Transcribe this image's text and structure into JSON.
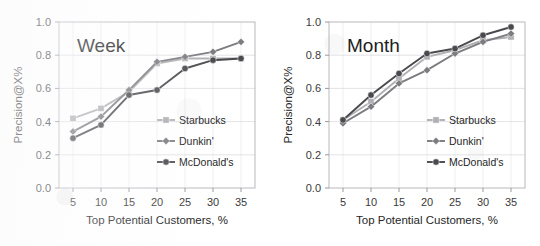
{
  "figure": {
    "panel_count": 2,
    "series_colors": {
      "starbucks": "#b0b0b4",
      "dunkin": "#7c7c80",
      "mcdonalds": "#4a4a4e"
    },
    "marker_shapes": {
      "starbucks": "square",
      "dunkin": "diamond",
      "mcdonalds": "circle"
    }
  },
  "chart_data": [
    {
      "type": "line",
      "title": "Week",
      "xlabel": "Top Potential Customers, %",
      "ylabel": "Precision@X%",
      "x": [
        5,
        10,
        15,
        20,
        25,
        30,
        35
      ],
      "xticklabels": [
        "5",
        "10",
        "15",
        "20",
        "25",
        "30",
        "35"
      ],
      "yticklabels": [
        "0.0",
        "0.2",
        "0.4",
        "0.6",
        "0.8",
        "1.0"
      ],
      "xlim": [
        2.5,
        37.5
      ],
      "ylim": [
        0.0,
        1.0
      ],
      "grid": true,
      "legend_position": "lower-right-inside",
      "series": [
        {
          "name": "Starbucks",
          "values": [
            0.42,
            0.48,
            0.58,
            0.75,
            0.78,
            0.78,
            0.78
          ]
        },
        {
          "name": "Dunkin'",
          "values": [
            0.34,
            0.43,
            0.59,
            0.76,
            0.79,
            0.82,
            0.88
          ]
        },
        {
          "name": "McDonald's",
          "values": [
            0.3,
            0.38,
            0.56,
            0.59,
            0.72,
            0.77,
            0.78
          ]
        }
      ]
    },
    {
      "type": "line",
      "title": "Month",
      "xlabel": "Top Potential Customers, %",
      "ylabel": "Precision@X%",
      "x": [
        5,
        10,
        15,
        20,
        25,
        30,
        35
      ],
      "xticklabels": [
        "5",
        "10",
        "15",
        "20",
        "25",
        "30",
        "35"
      ],
      "yticklabels": [
        "0.0",
        "0.2",
        "0.4",
        "0.6",
        "0.8",
        "1.0"
      ],
      "xlim": [
        2.5,
        37.5
      ],
      "ylim": [
        0.0,
        1.0
      ],
      "grid": true,
      "legend_position": "lower-right-inside",
      "series": [
        {
          "name": "Starbucks",
          "values": [
            0.41,
            0.52,
            0.66,
            0.79,
            0.83,
            0.89,
            0.91
          ]
        },
        {
          "name": "Dunkin'",
          "values": [
            0.39,
            0.49,
            0.63,
            0.71,
            0.81,
            0.88,
            0.93
          ]
        },
        {
          "name": "McDonald's",
          "values": [
            0.41,
            0.56,
            0.69,
            0.81,
            0.84,
            0.92,
            0.97
          ]
        }
      ]
    }
  ]
}
